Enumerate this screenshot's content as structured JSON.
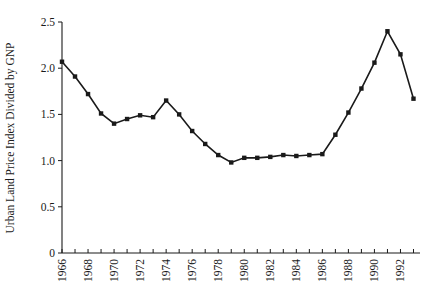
{
  "chart_data": {
    "type": "line",
    "title": "",
    "xlabel": "",
    "ylabel": "Urban Land Price Index Divided by GNP",
    "xlim": [
      1966,
      1993.5
    ],
    "ylim": [
      0,
      2.5
    ],
    "grid": false,
    "legend": null,
    "marker": "square",
    "line_color": "#1a1a1a",
    "x": [
      1966,
      1967,
      1968,
      1969,
      1970,
      1971,
      1972,
      1973,
      1974,
      1975,
      1976,
      1977,
      1978,
      1979,
      1980,
      1981,
      1982,
      1983,
      1984,
      1985,
      1986,
      1987,
      1988,
      1989,
      1990,
      1991,
      1992,
      1993
    ],
    "values": [
      2.07,
      1.91,
      1.72,
      1.51,
      1.4,
      1.45,
      1.49,
      1.47,
      1.65,
      1.5,
      1.32,
      1.18,
      1.06,
      0.98,
      1.03,
      1.03,
      1.04,
      1.06,
      1.05,
      1.06,
      1.07,
      1.28,
      1.52,
      1.78,
      2.06,
      2.4,
      2.15,
      1.67
    ],
    "yticks": [
      0,
      0.5,
      1.0,
      1.5,
      2.0,
      2.5
    ],
    "ytick_labels": [
      "0",
      "0.5",
      "1.0",
      "1.5",
      "2.0",
      "2.5"
    ],
    "xticks": [
      1966,
      1967,
      1968,
      1969,
      1970,
      1971,
      1972,
      1973,
      1974,
      1975,
      1976,
      1977,
      1978,
      1979,
      1980,
      1981,
      1982,
      1983,
      1984,
      1985,
      1986,
      1987,
      1988,
      1989,
      1990,
      1991,
      1992,
      1993
    ],
    "xtick_labels": [
      "1966",
      "",
      "1968",
      "",
      "1970",
      "",
      "1972",
      "",
      "1974",
      "",
      "1976",
      "",
      "1978",
      "",
      "1980",
      "",
      "1982",
      "",
      "1984",
      "",
      "1986",
      "",
      "1988",
      "",
      "1990",
      "",
      "1992",
      ""
    ]
  }
}
